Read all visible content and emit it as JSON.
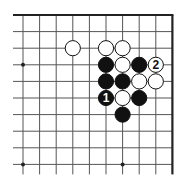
{
  "board": {
    "origin_x": 23,
    "origin_y": 15,
    "spacing": 16.6,
    "columns": 10,
    "rows": 10,
    "line_color": "#555555",
    "edge_color": "#222222",
    "top_edge": true,
    "right_edge": true,
    "left_edge": false,
    "bottom_edge": false
  },
  "star_points": [
    {
      "col": 0,
      "row": 3
    },
    {
      "col": 0,
      "row": 9
    },
    {
      "col": 6,
      "row": 9
    }
  ],
  "stones": [
    {
      "col": 3,
      "row": 2,
      "color": "white",
      "label": ""
    },
    {
      "col": 5,
      "row": 2,
      "color": "white",
      "label": ""
    },
    {
      "col": 6,
      "row": 2,
      "color": "white",
      "label": ""
    },
    {
      "col": 5,
      "row": 3,
      "color": "black",
      "label": ""
    },
    {
      "col": 6,
      "row": 3,
      "color": "white",
      "label": ""
    },
    {
      "col": 7,
      "row": 3,
      "color": "black",
      "label": ""
    },
    {
      "col": 8,
      "row": 3,
      "color": "white",
      "label": "2"
    },
    {
      "col": 5,
      "row": 4,
      "color": "black",
      "label": ""
    },
    {
      "col": 6,
      "row": 4,
      "color": "black",
      "label": ""
    },
    {
      "col": 7,
      "row": 4,
      "color": "white",
      "label": ""
    },
    {
      "col": 8,
      "row": 4,
      "color": "white",
      "label": ""
    },
    {
      "col": 5,
      "row": 5,
      "color": "black",
      "label": "1"
    },
    {
      "col": 6,
      "row": 5,
      "color": "white",
      "label": ""
    },
    {
      "col": 7,
      "row": 5,
      "color": "black",
      "label": ""
    },
    {
      "col": 6,
      "row": 6,
      "color": "black",
      "label": ""
    }
  ],
  "move_labels": {
    "black_move": "1",
    "white_move": "2"
  }
}
